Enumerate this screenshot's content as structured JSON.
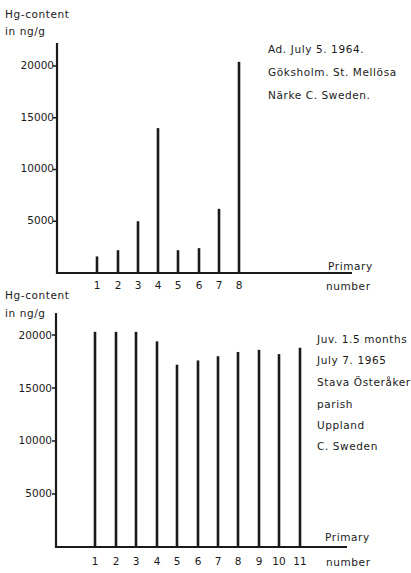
{
  "chart_data": [
    {
      "type": "bar",
      "title": "",
      "ylabel": "Hg-content in ng/g",
      "xlabel": "Primary number",
      "categories": [
        "1",
        "2",
        "3",
        "4",
        "5",
        "6",
        "7",
        "8"
      ],
      "values": [
        1600,
        2200,
        5000,
        14000,
        2200,
        2400,
        6200,
        20400
      ],
      "yticks": [
        5000,
        10000,
        15000,
        20000
      ],
      "ylim": [
        0,
        22000
      ],
      "grid": false,
      "annotation": [
        "Ad.  July 5. 1964.",
        "Göksholm.  St. Mellösa",
        "Närke   C. Sweden."
      ]
    },
    {
      "type": "bar",
      "title": "",
      "ylabel": "Hg-content in ng/g",
      "xlabel": "Primary number",
      "categories": [
        "1",
        "2",
        "3",
        "4",
        "5",
        "6",
        "7",
        "8",
        "9",
        "10",
        "11"
      ],
      "values": [
        20300,
        20300,
        20300,
        19400,
        17200,
        17600,
        18000,
        18400,
        18600,
        18200,
        18800
      ],
      "yticks": [
        5000,
        10000,
        15000,
        20000
      ],
      "ylim": [
        0,
        22000
      ],
      "grid": false,
      "annotation": [
        "Juv.  1.5 months",
        "July 7.  1965",
        "Stava Österåker",
        "parish",
        "Uppland",
        "C. Sweden"
      ]
    }
  ],
  "top": {
    "ylabel_line1": "Hg-content",
    "ylabel_line2": "in ng/g",
    "yticks": [
      "20000",
      "15000",
      "10000",
      "5000"
    ],
    "xticks": [
      "1",
      "2",
      "3",
      "4",
      "5",
      "6",
      "7",
      "8"
    ],
    "xlabel_line1": "Primary",
    "xlabel_line2": "number",
    "ann": [
      "Ad.  July 5. 1964.",
      "Göksholm.  St. Mellösa",
      "Närke   C. Sweden."
    ]
  },
  "bottom": {
    "ylabel_line1": "Hg-content",
    "ylabel_line2": "in ng/g",
    "yticks": [
      "20000",
      "15000",
      "10000",
      "5000"
    ],
    "xticks": [
      "1",
      "2",
      "3",
      "4",
      "5",
      "6",
      "7",
      "8",
      "9",
      "10",
      "11"
    ],
    "xlabel_line1": "Primary",
    "xlabel_line2": "number",
    "ann": [
      "Juv.  1.5 months",
      "July 7.  1965",
      "Stava Österåker",
      "parish",
      "Uppland",
      "C. Sweden"
    ]
  }
}
